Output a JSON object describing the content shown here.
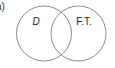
{
  "part_label": "a)",
  "venn": {
    "stroke_color": "#8a8a8a",
    "sets": [
      {
        "label": "D",
        "italic": true
      },
      {
        "label": "F.T.",
        "italic": false
      }
    ]
  }
}
